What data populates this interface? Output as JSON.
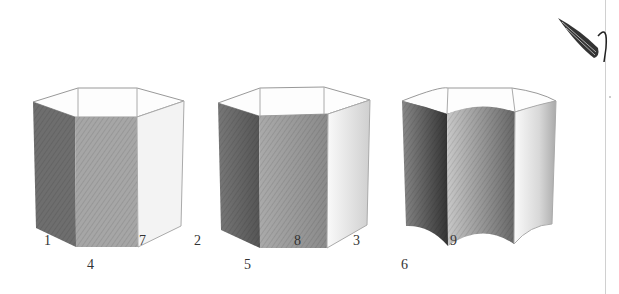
{
  "illustration": {
    "description": "Pencil shading study of three hexagonal prisms showing tonal values on faces",
    "figures": [
      {
        "id": "flat-prism",
        "labels": [
          "1",
          "4",
          "7"
        ]
      },
      {
        "id": "gradient-prism",
        "labels": [
          "2",
          "5",
          "8"
        ]
      },
      {
        "id": "concave-prism",
        "labels": [
          "3",
          "6",
          "9"
        ]
      }
    ],
    "labels": {
      "l1": "1",
      "l2": "2",
      "l3": "3",
      "l4": "4",
      "l5": "5",
      "l6": "6",
      "l7": "7",
      "l8": "8",
      "l9": "9"
    },
    "decoration": "winged-emblem"
  }
}
